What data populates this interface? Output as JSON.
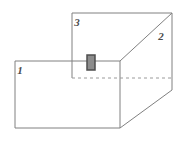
{
  "figure": {
    "background_color": "#ffffff",
    "line_color": "#808080",
    "line_color_dark": "#6e6e6e",
    "line_width": 1,
    "labels": [
      {
        "id": "face-1",
        "text": "1",
        "x": 20,
        "y": 74,
        "description": "front-left face label"
      },
      {
        "id": "face-2",
        "text": "2",
        "x": 161,
        "y": 40,
        "description": "right face label"
      },
      {
        "id": "face-3",
        "text": "3",
        "x": 77,
        "y": 26,
        "description": "top face label"
      }
    ],
    "solid_edges": [
      {
        "id": "top-face-top-edge",
        "x1": 72,
        "y1": 13,
        "x2": 172,
        "y2": 13
      },
      {
        "id": "top-face-left-edge",
        "x1": 72,
        "y1": 13,
        "x2": 72,
        "y2": 78
      },
      {
        "id": "right-face-right-edge",
        "x1": 172,
        "y1": 13,
        "x2": 172,
        "y2": 90
      },
      {
        "id": "mid-horizontal-edge",
        "x1": 15,
        "y1": 61,
        "x2": 120,
        "y2": 61
      },
      {
        "id": "front-face-left-edge",
        "x1": 15,
        "y1": 61,
        "x2": 15,
        "y2": 128
      },
      {
        "id": "front-face-bottom-edge",
        "x1": 15,
        "y1": 128,
        "x2": 120,
        "y2": 128
      },
      {
        "id": "front-face-right-edge",
        "x1": 120,
        "y1": 61,
        "x2": 120,
        "y2": 128
      },
      {
        "id": "upper-diagonal-edge",
        "x1": 120,
        "y1": 61,
        "x2": 172,
        "y2": 13
      },
      {
        "id": "lower-diagonal-edge",
        "x1": 120,
        "y1": 128,
        "x2": 172,
        "y2": 90
      }
    ],
    "dashed_edges": [
      {
        "id": "hidden-back-edge",
        "x1": 72,
        "y1": 78,
        "x2": 172,
        "y2": 78,
        "dash": "3,3"
      }
    ],
    "marker": {
      "id": "gray-block-marker",
      "x": 87,
      "y": 55,
      "width": 8,
      "height": 15,
      "fill_color": "#8c8c8c",
      "stroke_color": "#4d4d4d",
      "stroke_width": 1.5,
      "description": "small shaded rectangle straddling the top and front face boundary"
    }
  }
}
